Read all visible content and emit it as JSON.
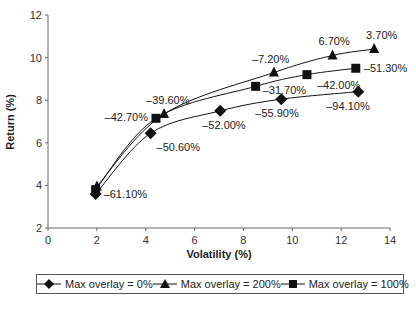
{
  "chart_data": {
    "type": "line",
    "title": "",
    "xlabel": "Volatility (%)",
    "ylabel": "Return (%)",
    "xlim": [
      0,
      14
    ],
    "ylim": [
      2,
      12
    ],
    "xticks": [
      0,
      2,
      4,
      6,
      8,
      10,
      12,
      14
    ],
    "yticks": [
      2,
      4,
      6,
      8,
      10,
      12
    ],
    "grid": false,
    "legend_position": "bottom",
    "series": [
      {
        "name": "Max overlay = 0%",
        "marker": "diamond",
        "points": [
          {
            "x": 1.95,
            "y": 3.6,
            "label": "-61.10%"
          },
          {
            "x": 4.2,
            "y": 6.45,
            "label": "-50.60%"
          },
          {
            "x": 7.05,
            "y": 7.5,
            "label": "-52.00%"
          },
          {
            "x": 9.55,
            "y": 8.05,
            "label": "-55.90%"
          },
          {
            "x": 12.7,
            "y": 8.4,
            "label": "-94.10%"
          }
        ]
      },
      {
        "name": "Max overlay = 200%",
        "marker": "triangle",
        "points": [
          {
            "x": 2.0,
            "y": 3.95,
            "label": ""
          },
          {
            "x": 4.75,
            "y": 7.35,
            "label": "-39.60%"
          },
          {
            "x": 9.25,
            "y": 9.3,
            "label": "-7.20%"
          },
          {
            "x": 11.65,
            "y": 10.1,
            "label": "6.70%"
          },
          {
            "x": 13.35,
            "y": 10.4,
            "label": "3.70%"
          }
        ]
      },
      {
        "name": "Max overlay = 100%",
        "marker": "square",
        "points": [
          {
            "x": 1.95,
            "y": 3.8,
            "label": ""
          },
          {
            "x": 4.42,
            "y": 7.15,
            "label": "-42.70%"
          },
          {
            "x": 8.5,
            "y": 8.65,
            "label": "-31.70%"
          },
          {
            "x": 10.6,
            "y": 9.2,
            "label": "-42.00%"
          },
          {
            "x": 12.6,
            "y": 9.5,
            "label": "-51.30%"
          }
        ]
      }
    ]
  },
  "legend": {
    "items": [
      {
        "label": "Max overlay = 0%",
        "marker": "diamond"
      },
      {
        "label": "Max overlay = 200%",
        "marker": "triangle"
      },
      {
        "label": "Max overlay = 100%",
        "marker": "square"
      }
    ]
  }
}
